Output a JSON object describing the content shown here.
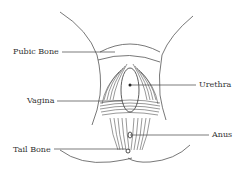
{
  "diagram": {
    "type": "anatomical-diagram",
    "labels": {
      "pubic_bone": "Pubic Bone",
      "urethra": "Urethra",
      "vagina": "Vagina",
      "anus": "Anus",
      "tail_bone": "Tail Bone"
    },
    "colors": {
      "line": "#444444",
      "text": "#333333",
      "background": "#ffffff"
    }
  }
}
